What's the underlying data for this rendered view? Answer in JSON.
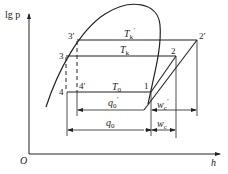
{
  "diagram": {
    "type": "refrigeration-cycle lg p-h diagram",
    "axes": {
      "y_label": "lg p",
      "x_label": "h",
      "origin": "O"
    },
    "points": [
      {
        "id": "1",
        "label": "1"
      },
      {
        "id": "2",
        "label": "2"
      },
      {
        "id": "2p",
        "label": "2′"
      },
      {
        "id": "3",
        "label": "3"
      },
      {
        "id": "3p",
        "label": "3′"
      },
      {
        "id": "4",
        "label": "4"
      },
      {
        "id": "4p",
        "label": "4′"
      }
    ],
    "isotherms": {
      "tk_prime": {
        "main": "T",
        "sub": "k",
        "sup": "′"
      },
      "tk": {
        "main": "T",
        "sub": "k"
      },
      "t0": {
        "main": "T",
        "sub": "0"
      }
    },
    "quantities": {
      "q0_prime": {
        "main": "q",
        "sub": "0",
        "sup": "′"
      },
      "q0": {
        "main": "q",
        "sub": "0"
      },
      "wc_prime": {
        "main": "w",
        "sub": "c",
        "sup": "′"
      },
      "wc": {
        "main": "w",
        "sub": "c"
      }
    }
  }
}
